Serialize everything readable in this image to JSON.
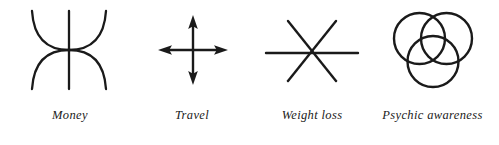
{
  "page": {
    "background_color": "#ffffff",
    "ink_color": "#1a1a1a"
  },
  "symbols": [
    {
      "id": "money",
      "label": "Money",
      "icon_name": "money-symbol-icon",
      "description": "Two opposing arcs crossing with a vertical line"
    },
    {
      "id": "travel",
      "label": "Travel",
      "icon_name": "travel-four-way-arrow-icon",
      "description": "Four-way arrow cross"
    },
    {
      "id": "weight-loss",
      "label": "Weight loss",
      "icon_name": "weight-loss-six-point-asterisk-icon",
      "description": "Six pointed asterisk: horizontal bar with two diagonals"
    },
    {
      "id": "psychic-awareness",
      "label": "Psychic awareness",
      "icon_name": "psychic-awareness-three-circles-icon",
      "description": "Three overlapping circles in triangular arrangement"
    }
  ]
}
